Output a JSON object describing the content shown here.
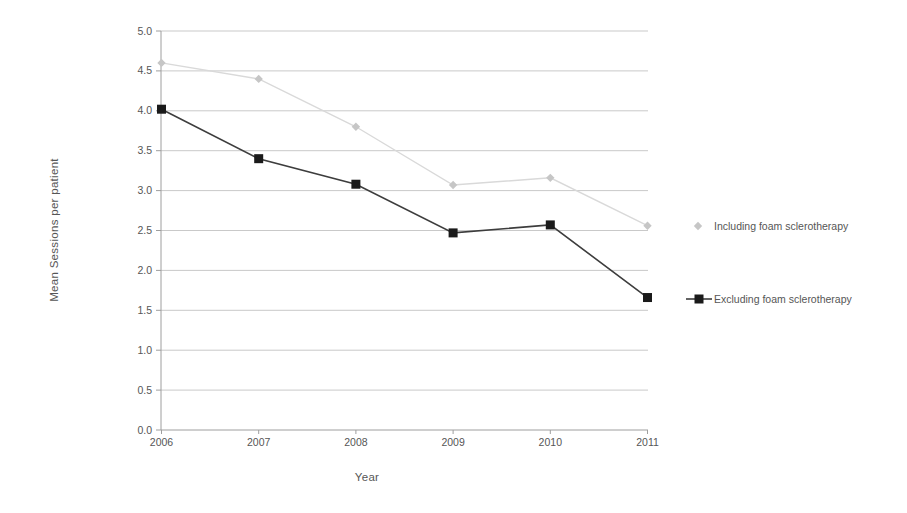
{
  "chart_data": {
    "type": "line",
    "title": "",
    "xlabel": "Year",
    "ylabel": "Mean Sessions per patient",
    "categories": [
      "2006",
      "2007",
      "2008",
      "2009",
      "2010",
      "2011"
    ],
    "series": [
      {
        "name": "Including foam sclerotherapy",
        "values": [
          4.6,
          4.4,
          3.8,
          3.07,
          3.16,
          2.56
        ],
        "line_color": "#d9d9d9",
        "marker": "diamond",
        "marker_color": "#c6c6c6"
      },
      {
        "name": "Excluding foam sclerotherapy",
        "values": [
          4.02,
          3.4,
          3.08,
          2.47,
          2.57,
          1.66
        ],
        "line_color": "#3d3d3d",
        "marker": "square",
        "marker_color": "#1a1a1a"
      }
    ],
    "ylim": [
      0,
      5
    ],
    "ytick_step": 0.5,
    "ytick_labels": [
      "0.0",
      "0.5",
      "1.0",
      "1.5",
      "2.0",
      "2.5",
      "3.0",
      "3.5",
      "4.0",
      "4.5",
      "5.0"
    ],
    "grid": true,
    "legend_position": "right",
    "layout": {
      "background": "#ffffff",
      "grid_color": "#c9c9c9",
      "axis_color": "#9e9e9e",
      "text_color": "#565656"
    }
  }
}
